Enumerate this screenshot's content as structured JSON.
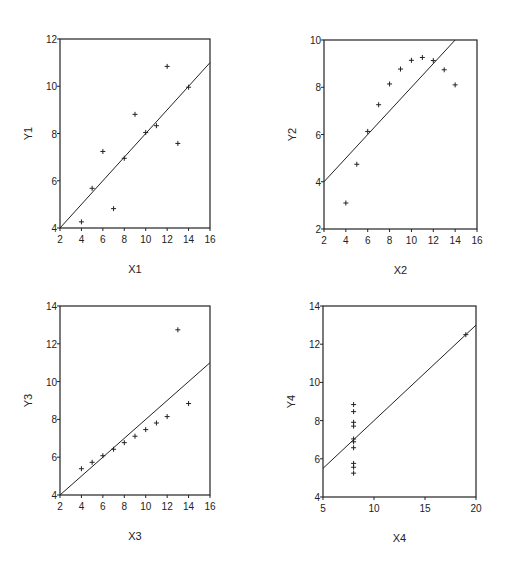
{
  "chart_data": [
    {
      "type": "scatter",
      "title": "",
      "xlabel": "X1",
      "ylabel": "Y1",
      "xlim": [
        2,
        16
      ],
      "ylim": [
        4,
        12
      ],
      "xticks": [
        2,
        4,
        6,
        8,
        10,
        12,
        14,
        16
      ],
      "yticks": [
        4,
        6,
        8,
        10,
        12
      ],
      "grid": false,
      "x": [
        10,
        8,
        13,
        9,
        11,
        14,
        6,
        4,
        12,
        7,
        5
      ],
      "y": [
        8.04,
        6.95,
        7.58,
        8.81,
        8.33,
        9.96,
        7.24,
        4.26,
        10.84,
        4.82,
        5.68
      ],
      "fit_line": {
        "intercept": 3.0,
        "slope": 0.5
      },
      "box": {
        "left": 60,
        "top": 39,
        "right": 210,
        "bottom": 228
      }
    },
    {
      "type": "scatter",
      "title": "",
      "xlabel": "X2",
      "ylabel": "Y2",
      "xlim": [
        2,
        16
      ],
      "ylim": [
        2,
        10
      ],
      "xticks": [
        2,
        4,
        6,
        8,
        10,
        12,
        14,
        16
      ],
      "yticks": [
        2,
        4,
        6,
        8,
        10
      ],
      "grid": false,
      "x": [
        10,
        8,
        13,
        9,
        11,
        14,
        6,
        4,
        12,
        7,
        5
      ],
      "y": [
        9.14,
        8.14,
        8.74,
        8.77,
        9.26,
        8.1,
        6.13,
        3.1,
        9.13,
        7.26,
        4.74
      ],
      "fit_line": {
        "intercept": 3.0,
        "slope": 0.5
      },
      "box": {
        "left": 324,
        "top": 40,
        "right": 477,
        "bottom": 229
      }
    },
    {
      "type": "scatter",
      "title": "",
      "xlabel": "X3",
      "ylabel": "Y3",
      "xlim": [
        2,
        16
      ],
      "ylim": [
        4,
        14
      ],
      "xticks": [
        2,
        4,
        6,
        8,
        10,
        12,
        14,
        16
      ],
      "yticks": [
        4,
        6,
        8,
        10,
        12,
        14
      ],
      "grid": false,
      "x": [
        10,
        8,
        13,
        9,
        11,
        14,
        6,
        4,
        12,
        7,
        5
      ],
      "y": [
        7.46,
        6.77,
        12.74,
        7.11,
        7.81,
        8.84,
        6.08,
        5.39,
        8.15,
        6.42,
        5.73
      ],
      "fit_line": {
        "intercept": 3.0,
        "slope": 0.5
      },
      "box": {
        "left": 60,
        "top": 306,
        "right": 210,
        "bottom": 495
      }
    },
    {
      "type": "scatter",
      "title": "",
      "xlabel": "X4",
      "ylabel": "Y4",
      "xlim": [
        5,
        20
      ],
      "ylim": [
        4,
        14
      ],
      "xticks": [
        5,
        10,
        15,
        20
      ],
      "yticks": [
        4,
        6,
        8,
        10,
        12,
        14
      ],
      "grid": false,
      "x": [
        8,
        8,
        8,
        8,
        8,
        8,
        8,
        19,
        8,
        8,
        8
      ],
      "y": [
        6.58,
        5.76,
        7.71,
        8.84,
        8.47,
        7.04,
        5.25,
        12.5,
        5.56,
        7.91,
        6.89
      ],
      "fit_line": {
        "intercept": 3.0,
        "slope": 0.5
      },
      "box": {
        "left": 323,
        "top": 306,
        "right": 476,
        "bottom": 497
      }
    }
  ]
}
